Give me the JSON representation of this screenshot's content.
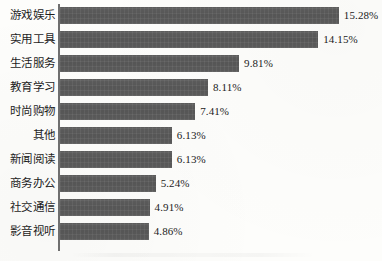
{
  "chart_data": {
    "type": "bar",
    "orientation": "horizontal",
    "title": "",
    "xlabel": "",
    "ylabel": "",
    "grid": false,
    "legend": null,
    "xlim": [
      0,
      17.5
    ],
    "value_suffix": "%",
    "categories": [
      "游戏娱乐",
      "实用工具",
      "生活服务",
      "教育学习",
      "时尚购物",
      "其他",
      "新闻阅读",
      "商务办公",
      "社交通信",
      "影音视听"
    ],
    "values": [
      15.28,
      14.15,
      9.81,
      8.11,
      7.41,
      6.13,
      6.13,
      5.24,
      4.91,
      4.86
    ],
    "value_labels": [
      "15.28%",
      "14.15%",
      "9.81%",
      "8.11%",
      "7.41%",
      "6.13%",
      "6.13%",
      "5.24%",
      "4.91%",
      "4.86%"
    ],
    "bar_color": "#585858",
    "axis_color": "#6f6f6f",
    "background_color": "#fdfdfb",
    "text_color": "#1a1a1a"
  }
}
